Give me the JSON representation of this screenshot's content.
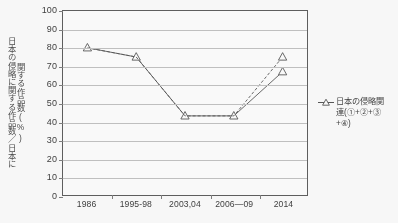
{
  "chart_data": {
    "type": "line",
    "title": "",
    "xlabel": "",
    "ylabel_line1": "日本の侵略に関する作品数／日本に",
    "ylabel_line2": "関する作品数(%)",
    "categories": [
      "1986",
      "1995-98",
      "2003,04",
      "2006—09",
      "2014"
    ],
    "ylim": [
      0,
      100
    ],
    "ytick_step": 10,
    "yticks": [
      "100",
      "90",
      "80",
      "70",
      "60",
      "50",
      "40",
      "30",
      "20",
      "10",
      "0"
    ],
    "grid": true,
    "legend_position": "right",
    "marker": "triangle-open",
    "series": [
      {
        "name": "日本の侵略関連(①+②+③+④)",
        "style": "solid",
        "values": [
          80,
          75,
          43,
          43,
          67
        ]
      },
      {
        "name": "日本の侵略関連(①+②+③+④)",
        "style": "dashed",
        "values": [
          80,
          75,
          43,
          43,
          75
        ]
      }
    ]
  },
  "legend": {
    "line1": "日本の侵略関",
    "line2": "連(①+②+③",
    "line3": "+④)"
  },
  "colors": {
    "line": "#555555",
    "grid": "#c2c2c2",
    "frame": "#5c5c5c",
    "text": "#3b3b3b"
  }
}
